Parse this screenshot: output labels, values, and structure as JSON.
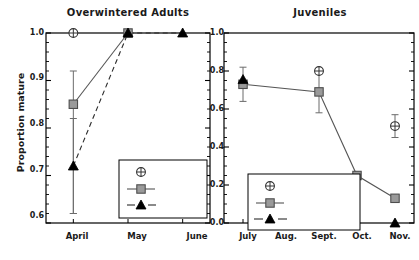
{
  "figure": {
    "ylabel": "Proportion mature",
    "background": "#ffffff",
    "frame_color": "#000000",
    "marker_fill_peak": "#9a9a9a",
    "marker_fill_decline": "#000000",
    "marker_fill_increase": "#ffffff"
  },
  "chart_data": [
    {
      "type": "line",
      "title": "Overwintered Adults",
      "xlabel": "",
      "ylabel": "Proportion mature",
      "categories": [
        "April",
        "May",
        "June"
      ],
      "ylim": [
        0.6,
        1.0
      ],
      "yticks": [
        "0.6",
        "0.7",
        "0.8",
        "0.9",
        "1.0"
      ],
      "ytick_values": [
        0.6,
        0.7,
        0.8,
        0.9,
        1.0
      ],
      "grid": false,
      "legend_position": "lower right",
      "series": [
        {
          "name": "Increase",
          "marker": "circle-plus",
          "line": "none",
          "x": [
            "April"
          ],
          "values": [
            1.0
          ],
          "err_low": [
            1.0
          ],
          "err_high": [
            1.0
          ]
        },
        {
          "name": "Peak",
          "marker": "square",
          "line": "solid",
          "x": [
            "April",
            "May"
          ],
          "values": [
            0.85,
            1.0
          ],
          "err_low": [
            0.62,
            1.0
          ],
          "err_high": [
            0.92,
            1.0
          ]
        },
        {
          "name": "Decline",
          "marker": "triangle",
          "line": "dashed",
          "x": [
            "April",
            "May",
            "June"
          ],
          "values": [
            0.72,
            1.0,
            1.0
          ],
          "err_low": [
            0.62,
            1.0,
            1.0
          ],
          "err_high": [
            0.82,
            1.0,
            1.0
          ]
        }
      ]
    },
    {
      "type": "line",
      "title": "Juveniles",
      "xlabel": "",
      "ylabel": "",
      "categories": [
        "July",
        "Aug.",
        "Sept.",
        "Oct.",
        "Nov."
      ],
      "ylim": [
        0.0,
        1.0
      ],
      "yticks": [
        "0.0",
        "0.2",
        "0.4",
        "0.6",
        "0.8",
        "1.0"
      ],
      "ytick_values": [
        0.0,
        0.2,
        0.4,
        0.6,
        0.8,
        1.0
      ],
      "grid": false,
      "legend_position": "lower left",
      "series": [
        {
          "name": "Increase",
          "marker": "circle-plus",
          "line": "none",
          "x": [
            "Sept.",
            "Nov."
          ],
          "values": [
            0.8,
            0.51
          ],
          "err_low": [
            0.8,
            0.45
          ],
          "err_high": [
            0.8,
            0.57
          ]
        },
        {
          "name": "Peak",
          "marker": "square",
          "line": "solid",
          "x": [
            "July",
            "Sept.",
            "Oct.",
            "Nov."
          ],
          "values": [
            0.73,
            0.69,
            0.25,
            0.13
          ],
          "err_low": [
            0.64,
            0.58,
            0.25,
            0.13
          ],
          "err_high": [
            0.82,
            0.8,
            0.25,
            0.13
          ]
        },
        {
          "name": "Decline",
          "marker": "triangle",
          "line": "none",
          "x": [
            "July",
            "Nov."
          ],
          "values": [
            0.755,
            0.0
          ],
          "err_low": [
            0.755,
            0.0
          ],
          "err_high": [
            0.755,
            0.0
          ]
        }
      ]
    }
  ],
  "left_panel": {
    "title": "Overwintered Adults",
    "yticks": [
      "1.0",
      "0.9",
      "0.8",
      "0.7",
      "0.6"
    ],
    "xticks": [
      "April",
      "May",
      "June"
    ],
    "legend": [
      "Increase",
      "Peak",
      "Decline"
    ]
  },
  "right_panel": {
    "title": "Juveniles",
    "yticks": [
      "1.0",
      "0.8",
      "0.6",
      "0.4",
      "0.2",
      "0.0"
    ],
    "xticks": [
      "July",
      "Aug.",
      "Sept.",
      "Oct.",
      "Nov."
    ],
    "legend": [
      "Increase",
      "Peak",
      "Decline"
    ]
  }
}
